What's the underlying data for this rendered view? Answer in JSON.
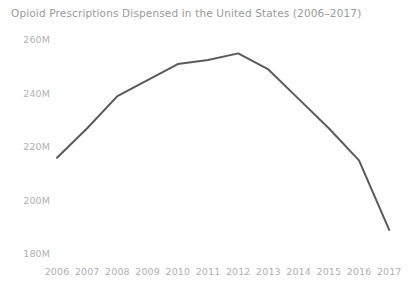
{
  "chart_data": {
    "type": "line",
    "title": "Opioid Prescriptions Dispensed in the United States (2006–2017)",
    "xlabel": "",
    "ylabel": "",
    "categories": [
      "2006",
      "2007",
      "2008",
      "2009",
      "2010",
      "2011",
      "2012",
      "2013",
      "2014",
      "2015",
      "2016",
      "2017"
    ],
    "x": [
      2006,
      2007,
      2008,
      2009,
      2010,
      2011,
      2012,
      2013,
      2014,
      2015,
      2016,
      2017
    ],
    "values": [
      216000000,
      227000000,
      239000000,
      245000000,
      251000000,
      252500000,
      255000000,
      249000000,
      238000000,
      227000000,
      215000000,
      189000000
    ],
    "value_labels": [
      "216M",
      "227M",
      "239M",
      "245M",
      "251M",
      "252.5M",
      "255M",
      "249M",
      "238M",
      "227M",
      "215M",
      "189M"
    ],
    "series": [
      {
        "name": "Opioid prescriptions dispensed",
        "values": [
          216000000,
          227000000,
          239000000,
          245000000,
          251000000,
          252500000,
          255000000,
          249000000,
          238000000,
          227000000,
          215000000,
          189000000
        ],
        "color": "#5a5a5a"
      }
    ],
    "ylim": [
      180000000,
      262000000
    ],
    "yticks": [
      180000000,
      200000000,
      220000000,
      240000000,
      260000000
    ],
    "ytick_labels": [
      "180M",
      "200M",
      "220M",
      "240M",
      "260M"
    ],
    "xtick_labels": [
      "2006",
      "2007",
      "2008",
      "2009",
      "2010",
      "2011",
      "2012",
      "2013",
      "2014",
      "2015",
      "2016",
      "2017"
    ],
    "grid": false,
    "legend": false,
    "legend_position": "none",
    "markers": false,
    "line_width": 2,
    "colors": {
      "line": "#5a5a5a",
      "title_text": "#9a9a9a",
      "tick_text": "#b0b0b0",
      "background": "#ffffff"
    }
  },
  "axes": {
    "y": {
      "ticks": [
        {
          "label": "260M",
          "value": 260000000
        },
        {
          "label": "240M",
          "value": 240000000
        },
        {
          "label": "220M",
          "value": 220000000
        },
        {
          "label": "200M",
          "value": 200000000
        },
        {
          "label": "180M",
          "value": 180000000
        }
      ]
    },
    "x": {
      "ticks": [
        {
          "label": "2006"
        },
        {
          "label": "2007"
        },
        {
          "label": "2008"
        },
        {
          "label": "2009"
        },
        {
          "label": "2010"
        },
        {
          "label": "2011"
        },
        {
          "label": "2012"
        },
        {
          "label": "2013"
        },
        {
          "label": "2014"
        },
        {
          "label": "2015"
        },
        {
          "label": "2016"
        },
        {
          "label": "2017"
        }
      ]
    }
  }
}
